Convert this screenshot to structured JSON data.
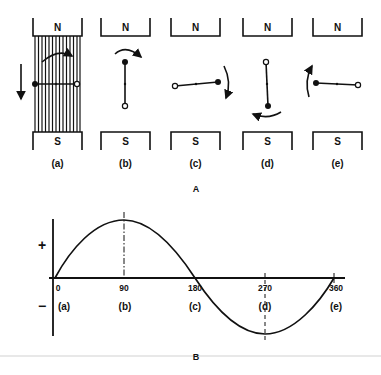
{
  "panel_a": {
    "caption": "A",
    "positions": [
      {
        "id": "a",
        "label": "(a)",
        "north": "N",
        "south": "S"
      },
      {
        "id": "b",
        "label": "(b)",
        "north": "N",
        "south": "S"
      },
      {
        "id": "c",
        "label": "(c)",
        "north": "N",
        "south": "S"
      },
      {
        "id": "d",
        "label": "(d)",
        "north": "N",
        "south": "S"
      },
      {
        "id": "e",
        "label": "(e)",
        "north": "N",
        "south": "S"
      }
    ]
  },
  "panel_b": {
    "caption": "B",
    "plus_sign": "+",
    "minus_sign": "−",
    "ticks": [
      {
        "deg": "0",
        "pos": "(a)"
      },
      {
        "deg": "90",
        "pos": "(b)"
      },
      {
        "deg": "180",
        "pos": "(c)"
      },
      {
        "deg": "270",
        "pos": "(d)"
      },
      {
        "deg": "360",
        "pos": "(e)"
      }
    ]
  },
  "colors": {
    "ink": "#111111",
    "background": "#ffffff",
    "rule": "#d8d8d8"
  }
}
